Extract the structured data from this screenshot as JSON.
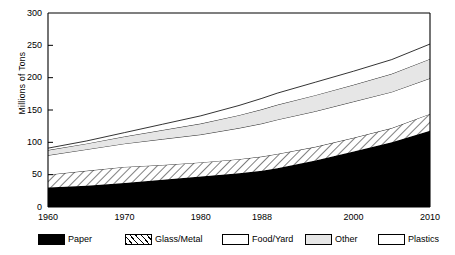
{
  "chart_data": {
    "type": "area",
    "title": "",
    "xlabel": "",
    "ylabel": "Millions of Tons",
    "xlim": [
      1960,
      2010
    ],
    "ylim": [
      0,
      300
    ],
    "y_ticks": [
      0,
      50,
      100,
      150,
      200,
      250,
      300
    ],
    "x_ticks": [
      1960,
      1970,
      1980,
      1988,
      2000,
      2010
    ],
    "x_tick_labels": [
      "1960",
      "1970",
      "1980",
      "1988",
      "2000",
      "2010"
    ],
    "y_tick_labels": [
      "0",
      "50",
      "100",
      "150",
      "200",
      "250",
      "300"
    ],
    "grid": false,
    "stacked": true,
    "legend_position": "below",
    "x": [
      1960,
      1965,
      1970,
      1975,
      1980,
      1985,
      1988,
      1990,
      1995,
      2000,
      2005,
      2010
    ],
    "series": [
      {
        "name": "Paper",
        "fill": "solid-black",
        "color": "#000000",
        "values": [
          30,
          33,
          37,
          42,
          47,
          52,
          56,
          60,
          72,
          86,
          100,
          118
        ]
      },
      {
        "name": "Glass/Metal",
        "fill": "diagonal-hatch",
        "color": "#ffffff",
        "values": [
          20,
          23,
          25,
          23,
          22,
          22,
          22,
          22,
          21,
          21,
          22,
          26
        ]
      },
      {
        "name": "Food/Yard",
        "fill": "white",
        "color": "#ffffff",
        "values": [
          30,
          33,
          36,
          40,
          43,
          48,
          51,
          53,
          55,
          56,
          56,
          55
        ]
      },
      {
        "name": "Other",
        "fill": "light-gray",
        "color": "#e6e6e6",
        "values": [
          8,
          9,
          11,
          14,
          17,
          20,
          22,
          23,
          25,
          26,
          28,
          30
        ]
      },
      {
        "name": "Plastics",
        "fill": "white",
        "color": "#ffffff",
        "values": [
          3,
          4,
          6,
          9,
          12,
          15,
          17,
          18,
          20,
          21,
          22,
          23
        ]
      }
    ],
    "cumulative_totals": [
      91,
      102,
      115,
      128,
      141,
      157,
      168,
      176,
      193,
      210,
      228,
      252
    ],
    "legend_entries": [
      "Paper",
      "Glass/Metal",
      "Food/Yard",
      "Other",
      "Plastics"
    ]
  },
  "legend": {
    "items": [
      {
        "label": "Paper",
        "swatch": "sw-paper"
      },
      {
        "label": "Glass/Metal",
        "swatch": "sw-glass"
      },
      {
        "label": "Food/Yard",
        "swatch": "sw-white"
      },
      {
        "label": "Other",
        "swatch": "sw-other"
      },
      {
        "label": "Plastics",
        "swatch": "sw-white"
      }
    ]
  },
  "axis": {
    "y_title": "Millions of Tons"
  }
}
